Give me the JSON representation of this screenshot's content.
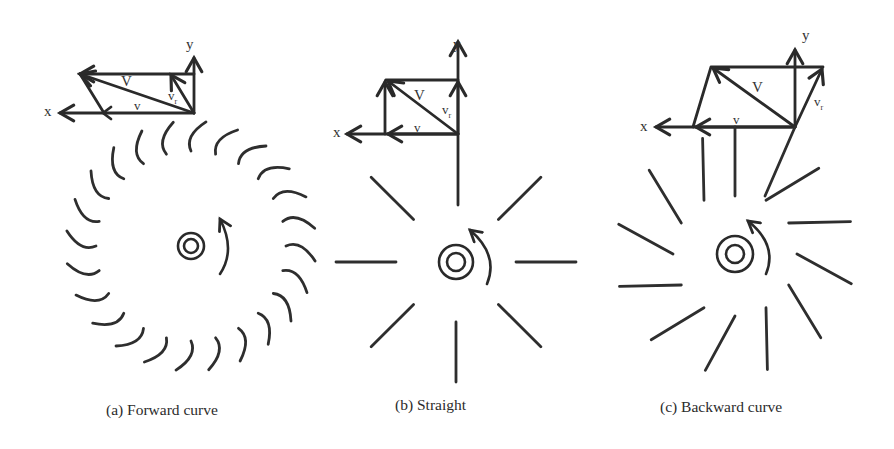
{
  "figure": {
    "panels": [
      {
        "id": "a",
        "caption": "(a) Forward curve",
        "axis_x_label": "x",
        "axis_y_label": "y",
        "vector_labels": {
          "resultant": "V",
          "blade_tip": "v",
          "relative": "v",
          "relative_sub": "r"
        },
        "blade_type": "forward-curved",
        "blade_count": 24,
        "rotation": "counter-clockwise"
      },
      {
        "id": "b",
        "caption": "(b) Straight",
        "axis_x_label": "x",
        "axis_y_label": "y",
        "vector_labels": {
          "resultant": "V",
          "blade_tip": "v",
          "relative": "v",
          "relative_sub": "r"
        },
        "blade_type": "straight radial",
        "blade_count": 8,
        "rotation": "counter-clockwise"
      },
      {
        "id": "c",
        "caption": "(c) Backward curve",
        "axis_x_label": "x",
        "axis_y_label": "y",
        "vector_labels": {
          "resultant": "V",
          "blade_tip": "v",
          "relative": "v",
          "relative_sub": "r"
        },
        "blade_type": "backward-inclined",
        "blade_count": 12,
        "rotation": "counter-clockwise"
      }
    ],
    "colors": {
      "ink": "#2a2a2a",
      "background": "#ffffff"
    }
  }
}
